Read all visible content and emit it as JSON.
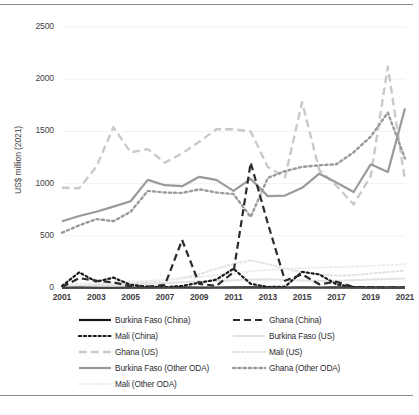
{
  "chart_data": {
    "type": "line",
    "title": "",
    "xlabel": "",
    "ylabel": "US$ million (2021)",
    "ylim": [
      0,
      2500
    ],
    "yticks": [
      0,
      500,
      1000,
      1500,
      2000,
      2500
    ],
    "xlim": [
      2001,
      2021
    ],
    "x": [
      2001,
      2002,
      2003,
      2004,
      2005,
      2006,
      2007,
      2008,
      2009,
      2010,
      2011,
      2012,
      2013,
      2014,
      2015,
      2016,
      2017,
      2018,
      2019,
      2020,
      2021
    ],
    "xticks": [
      2001,
      2003,
      2005,
      2007,
      2009,
      2011,
      2013,
      2015,
      2017,
      2019,
      2021
    ],
    "grid": "horizontal-light",
    "legend_position": "below",
    "series": [
      {
        "name": "Burkina Faso (China)",
        "style": "solid",
        "color": "#1a1a1a",
        "width": 2.2,
        "values": [
          2,
          3,
          2,
          2,
          3,
          4,
          5,
          6,
          4,
          5,
          6,
          7,
          6,
          5,
          6,
          5,
          6,
          5,
          5,
          4,
          4
        ]
      },
      {
        "name": "Ghana (China)",
        "style": "dashed",
        "color": "#2b2b2b",
        "width": 2.2,
        "values": [
          10,
          95,
          70,
          55,
          15,
          12,
          30,
          460,
          40,
          20,
          150,
          1200,
          620,
          70,
          130,
          35,
          60,
          10,
          8,
          6,
          5
        ]
      },
      {
        "name": "Mali (China)",
        "style": "dotted",
        "color": "#1a1a1a",
        "width": 2.2,
        "values": [
          18,
          150,
          60,
          100,
          30,
          12,
          8,
          20,
          50,
          80,
          185,
          40,
          10,
          12,
          155,
          130,
          35,
          8,
          6,
          5,
          4
        ]
      },
      {
        "name": "Burkina Faso (US)",
        "style": "solid",
        "color": "#e2e2e2",
        "width": 2.0,
        "values": [
          15,
          18,
          22,
          28,
          34,
          40,
          48,
          55,
          62,
          68,
          74,
          80,
          84,
          78,
          72,
          68,
          70,
          74,
          80,
          86,
          92
        ]
      },
      {
        "name": "Ghana (US)",
        "style": "dashed",
        "color": "#c9c9c9",
        "width": 2.4,
        "values": [
          960,
          955,
          1160,
          1540,
          1300,
          1330,
          1200,
          1290,
          1400,
          1520,
          1520,
          1500,
          1160,
          1060,
          1780,
          1130,
          980,
          800,
          1070,
          2120,
          1030
        ]
      },
      {
        "name": "Mali (US)",
        "style": "dotted",
        "color": "#e2e2e2",
        "width": 2.0,
        "values": [
          20,
          26,
          32,
          40,
          48,
          58,
          74,
          96,
          132,
          185,
          230,
          265,
          230,
          185,
          150,
          130,
          118,
          124,
          138,
          152,
          168
        ]
      },
      {
        "name": "Burkina Faso (Other ODA)",
        "style": "solid",
        "color": "#9a9a9a",
        "width": 2.2,
        "values": [
          640,
          690,
          730,
          780,
          830,
          1035,
          985,
          975,
          1065,
          1035,
          930,
          1045,
          880,
          885,
          960,
          1095,
          1010,
          920,
          1185,
          1110,
          1720
        ]
      },
      {
        "name": "Ghana (Other ODA)",
        "style": "dotted",
        "color": "#9a9a9a",
        "width": 2.4,
        "values": [
          530,
          600,
          660,
          640,
          730,
          930,
          915,
          910,
          945,
          915,
          900,
          680,
          1055,
          1120,
          1160,
          1175,
          1185,
          1300,
          1450,
          1680,
          1240
        ]
      },
      {
        "name": "Mali (Other ODA)",
        "style": "dotted",
        "color": "#ededed",
        "width": 2.0,
        "values": [
          40,
          45,
          50,
          55,
          60,
          68,
          78,
          90,
          105,
          122,
          140,
          158,
          172,
          182,
          190,
          196,
          200,
          206,
          212,
          220,
          228
        ]
      }
    ]
  },
  "axis": {
    "y_tick_labels": [
      "0",
      "500",
      "1000",
      "1500",
      "2000",
      "2500"
    ],
    "x_tick_labels": [
      "2001",
      "2003",
      "2005",
      "2007",
      "2009",
      "2011",
      "2013",
      "2015",
      "2017",
      "2019",
      "2021"
    ],
    "y_axis_title": "US$ million (2021)"
  },
  "legend": {
    "entries": [
      {
        "label": "Burkina Faso (China)",
        "col": 0,
        "row": 0
      },
      {
        "label": "Ghana (China)",
        "col": 1,
        "row": 0
      },
      {
        "label": "Mali (China)",
        "col": 0,
        "row": 1
      },
      {
        "label": "Burkina Faso (US)",
        "col": 1,
        "row": 1
      },
      {
        "label": "Ghana (US)",
        "col": 0,
        "row": 2
      },
      {
        "label": "Mali (US)",
        "col": 1,
        "row": 2
      },
      {
        "label": "Burkina Faso (Other ODA)",
        "col": 0,
        "row": 3
      },
      {
        "label": "Ghana (Other ODA)",
        "col": 1,
        "row": 3
      },
      {
        "label": "Mali (Other ODA)",
        "col": 0,
        "row": 4
      }
    ]
  }
}
